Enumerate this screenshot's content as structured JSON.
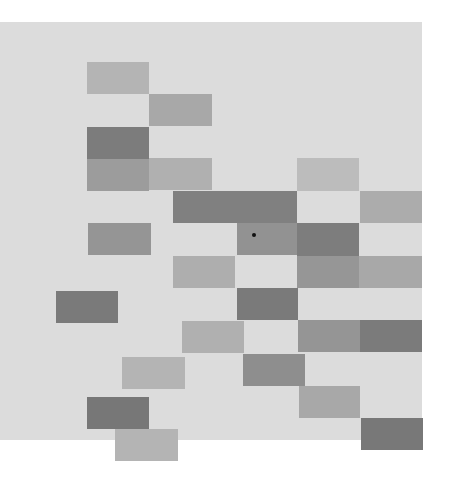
{
  "scene": {
    "background_color": "#ffffff",
    "panel": {
      "x": 0,
      "y": 22,
      "w": 422,
      "h": 418,
      "color": "#dcdcdc"
    },
    "blocks": [
      {
        "x": 87,
        "y": 62,
        "w": 62,
        "h": 32,
        "color": "#b4b4b4"
      },
      {
        "x": 149,
        "y": 94,
        "w": 63,
        "h": 32,
        "color": "#a8a8a8"
      },
      {
        "x": 87,
        "y": 127,
        "w": 62,
        "h": 32,
        "color": "#7c7c7c"
      },
      {
        "x": 87,
        "y": 159,
        "w": 62,
        "h": 32,
        "color": "#9c9c9c"
      },
      {
        "x": 149,
        "y": 158,
        "w": 63,
        "h": 32,
        "color": "#b0b0b0"
      },
      {
        "x": 297,
        "y": 158,
        "w": 62,
        "h": 33,
        "color": "#bcbcbc"
      },
      {
        "x": 173,
        "y": 191,
        "w": 124,
        "h": 32,
        "color": "#808080"
      },
      {
        "x": 360,
        "y": 191,
        "w": 62,
        "h": 32,
        "color": "#acacac"
      },
      {
        "x": 88,
        "y": 223,
        "w": 63,
        "h": 32,
        "color": "#959595"
      },
      {
        "x": 237,
        "y": 223,
        "w": 60,
        "h": 32,
        "color": "#929292"
      },
      {
        "x": 297,
        "y": 223,
        "w": 62,
        "h": 33,
        "color": "#7d7d7d"
      },
      {
        "x": 173,
        "y": 256,
        "w": 62,
        "h": 32,
        "color": "#aeaeae"
      },
      {
        "x": 297,
        "y": 256,
        "w": 62,
        "h": 32,
        "color": "#969696"
      },
      {
        "x": 359,
        "y": 256,
        "w": 63,
        "h": 32,
        "color": "#a8a8a8"
      },
      {
        "x": 56,
        "y": 291,
        "w": 62,
        "h": 32,
        "color": "#7a7a7a"
      },
      {
        "x": 237,
        "y": 288,
        "w": 61,
        "h": 32,
        "color": "#7a7a7a"
      },
      {
        "x": 182,
        "y": 321,
        "w": 62,
        "h": 32,
        "color": "#b0b0b0"
      },
      {
        "x": 298,
        "y": 320,
        "w": 62,
        "h": 32,
        "color": "#959595"
      },
      {
        "x": 360,
        "y": 320,
        "w": 62,
        "h": 32,
        "color": "#7b7b7b"
      },
      {
        "x": 122,
        "y": 357,
        "w": 63,
        "h": 32,
        "color": "#b4b4b4"
      },
      {
        "x": 243,
        "y": 354,
        "w": 62,
        "h": 32,
        "color": "#8e8e8e"
      },
      {
        "x": 299,
        "y": 386,
        "w": 61,
        "h": 32,
        "color": "#a8a8a8"
      },
      {
        "x": 87,
        "y": 397,
        "w": 62,
        "h": 32,
        "color": "#777777"
      },
      {
        "x": 115,
        "y": 429,
        "w": 63,
        "h": 32,
        "color": "#b4b4b4"
      },
      {
        "x": 361,
        "y": 418,
        "w": 62,
        "h": 32,
        "color": "#787878"
      }
    ],
    "marker": {
      "x": 252,
      "y": 233,
      "size": 4,
      "color": "#111111"
    }
  }
}
